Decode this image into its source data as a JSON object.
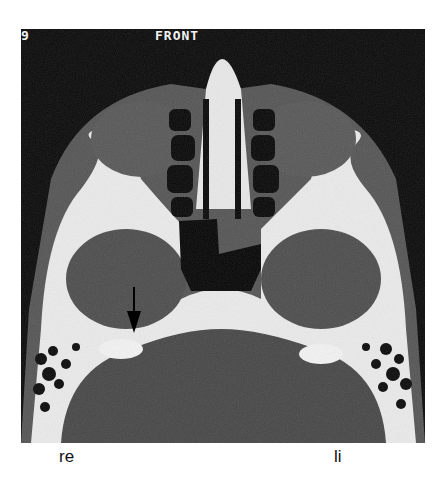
{
  "figure": {
    "type": "axial CT scan, skull base",
    "overlay": {
      "slice_number": "9",
      "orientation_label": "FRONT"
    },
    "annotation": {
      "arrow_icon": "down-arrow-icon"
    },
    "colors": {
      "background": "#0a0a0a",
      "soft_tissue": "#5a5a5a",
      "brain": "#4a4a4a",
      "bone": "#f0f0f0",
      "air": "#050505"
    }
  },
  "labels": {
    "right_side": "re",
    "left_side": "li"
  }
}
